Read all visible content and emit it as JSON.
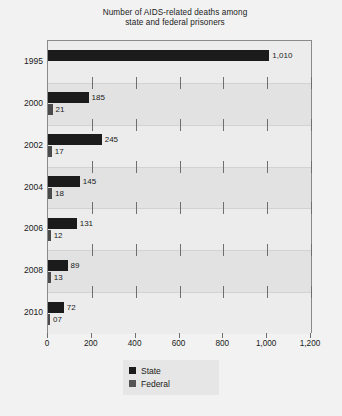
{
  "chart_data": {
    "type": "bar",
    "orientation": "horizontal",
    "title": "Number of AIDS-related deaths among state and federal prisoners",
    "title_lines": [
      "Number of AIDS-related deaths among",
      "state and federal prisoners"
    ],
    "xlabel": "",
    "ylabel": "",
    "categories": [
      "1995",
      "2000",
      "2002",
      "2004",
      "2006",
      "2008",
      "2010"
    ],
    "series": [
      {
        "name": "State",
        "color": "#1b1b1b",
        "values": [
          1010,
          185,
          245,
          145,
          131,
          89,
          72
        ],
        "labels": [
          "1,010",
          "185",
          "245",
          "145",
          "131",
          "89",
          "72"
        ]
      },
      {
        "name": "Federal",
        "color": "#4a4a4a",
        "values": [
          null,
          21,
          17,
          18,
          12,
          13,
          7
        ],
        "labels": [
          "",
          "21",
          "17",
          "18",
          "12",
          "13",
          "07"
        ]
      }
    ],
    "xlim": [
      0,
      1200
    ],
    "xticks": [
      0,
      200,
      400,
      600,
      800,
      1000,
      1200
    ],
    "xtick_labels": [
      "0",
      "200",
      "400",
      "600",
      "800",
      "1,000",
      "1,200"
    ],
    "grid": true,
    "legend_position": "bottom-center",
    "legend_entries": [
      "State",
      "Federal"
    ]
  },
  "colors": {
    "page_background": "#f2f2f2",
    "plot_background": "#e9e9e9",
    "band_light": "#ececec",
    "band_pale": "#e2e2e2",
    "frame": "#8a8a8a",
    "state": "#1b1b1b",
    "federal": "#4a4a4a",
    "text": "#1a1a1a",
    "legend_background": "#e6e6e6"
  },
  "footer": {
    "note": ""
  }
}
